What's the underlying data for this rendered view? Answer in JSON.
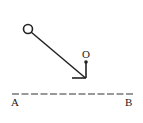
{
  "diagram": {
    "labels": {
      "pivot": "O",
      "left_end": "A",
      "right_end": "B"
    },
    "elements": {
      "ball": "hollow circle (pendulum bob)",
      "rod": "straight line from bob to bend point",
      "support": "vertical rod from pivot O down to bend, short horizontal segment to the left",
      "reference_line": "dashed horizontal line AB"
    },
    "colors": {
      "stroke": "#222222",
      "background": "#ffffff"
    }
  }
}
